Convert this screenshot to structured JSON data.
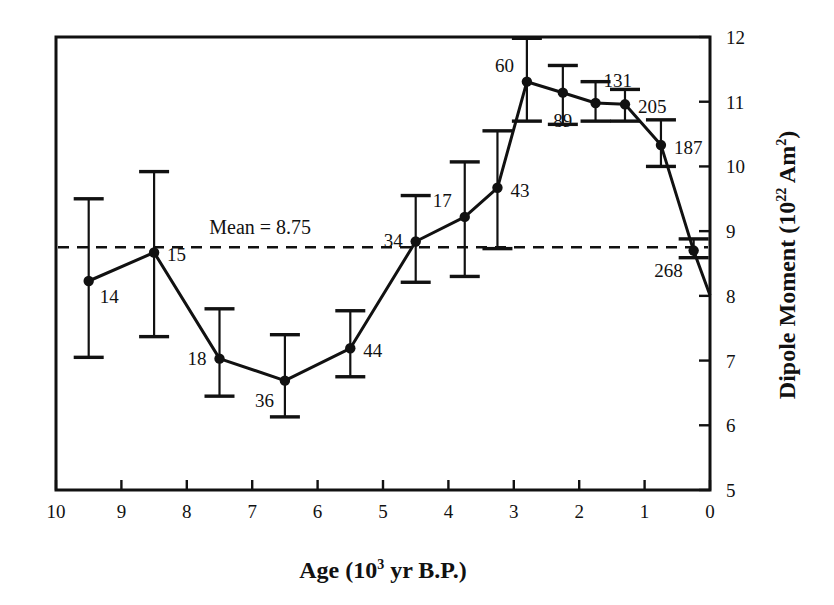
{
  "chart_data": {
    "type": "line",
    "title": "",
    "xlabel": "Age (10^3 yr B.P.)",
    "xlabel_parts": {
      "pre": "Age (10",
      "sup": "3",
      "post": " yr B.P.)"
    },
    "ylabel": "Dipole Moment (10^22 Am^2)",
    "ylabel_parts": {
      "pre": "Dipole Moment (10",
      "sup1": "22",
      "mid": " Am",
      "sup2": "2",
      "post": ")"
    },
    "xlim": [
      10,
      0
    ],
    "ylim": [
      5,
      12
    ],
    "x_reversed": true,
    "grid": false,
    "legend": "none",
    "xticks": [
      10,
      9,
      8,
      7,
      6,
      5,
      4,
      3,
      2,
      1,
      0
    ],
    "xtick_labels": [
      "10",
      "9",
      "8",
      "7",
      "6",
      "5",
      "4",
      "3",
      "2",
      "1",
      "0"
    ],
    "yticks": [
      5,
      6,
      7,
      8,
      9,
      10,
      11,
      12
    ],
    "ytick_labels": [
      "5",
      "6",
      "7",
      "8",
      "9",
      "10",
      "11",
      "12"
    ],
    "ytick_side": "right",
    "annotations": [
      {
        "name": "mean-line-label",
        "text": "Mean = 8.75",
        "x": 6.1,
        "y": 8.95
      }
    ],
    "mean": {
      "value": 8.75,
      "label": "Mean = 8.75",
      "style": "dashed"
    },
    "x": [
      9.5,
      8.5,
      7.5,
      6.5,
      5.5,
      4.5,
      3.75,
      3.25,
      2.8,
      2.25,
      1.75,
      1.3,
      0.75,
      0.25,
      0.0
    ],
    "values": [
      8.23,
      8.67,
      7.03,
      6.69,
      7.19,
      8.84,
      9.22,
      9.67,
      11.31,
      11.14,
      10.98,
      10.96,
      10.33,
      8.7,
      8.01
    ],
    "point_labels": [
      "14",
      "15",
      "18",
      "36",
      "44",
      "34",
      "17",
      "43",
      "60",
      "89",
      "131",
      "205",
      "187",
      "268",
      ""
    ],
    "point_label_pos": [
      "below-right",
      "right",
      "left",
      "below-left",
      "right",
      "left",
      "above-left",
      "right",
      "above-left",
      "below",
      "above-right",
      "right",
      "right",
      "below-left",
      ""
    ],
    "errors_low": [
      7.05,
      7.37,
      6.45,
      6.13,
      6.75,
      8.21,
      8.3,
      8.73,
      10.7,
      10.65,
      10.7,
      10.7,
      10.0,
      8.59,
      null
    ],
    "errors_high": [
      9.5,
      9.92,
      7.8,
      7.4,
      7.77,
      9.55,
      10.07,
      10.55,
      11.98,
      11.56,
      11.31,
      11.19,
      10.72,
      8.88,
      null
    ],
    "series": [
      {
        "name": "Dipole Moment",
        "points": [
          {
            "x": 9.5,
            "y": 8.23,
            "label": "14",
            "lo": 7.05,
            "hi": 9.5
          },
          {
            "x": 8.5,
            "y": 8.67,
            "label": "15",
            "lo": 7.37,
            "hi": 9.92
          },
          {
            "x": 7.5,
            "y": 7.03,
            "label": "18",
            "lo": 6.45,
            "hi": 7.8
          },
          {
            "x": 6.5,
            "y": 6.69,
            "label": "36",
            "lo": 6.13,
            "hi": 7.4
          },
          {
            "x": 5.5,
            "y": 7.19,
            "label": "44",
            "lo": 6.75,
            "hi": 7.77
          },
          {
            "x": 4.5,
            "y": 8.84,
            "label": "34",
            "lo": 8.21,
            "hi": 9.55
          },
          {
            "x": 3.75,
            "y": 9.22,
            "label": "17",
            "lo": 8.3,
            "hi": 10.07
          },
          {
            "x": 3.25,
            "y": 9.67,
            "label": "43",
            "lo": 8.73,
            "hi": 10.55
          },
          {
            "x": 2.8,
            "y": 11.31,
            "label": "60",
            "lo": 10.7,
            "hi": 11.98
          },
          {
            "x": 2.25,
            "y": 11.14,
            "label": "89",
            "lo": 10.65,
            "hi": 11.56
          },
          {
            "x": 1.75,
            "y": 10.98,
            "label": "131",
            "lo": 10.7,
            "hi": 11.31
          },
          {
            "x": 1.3,
            "y": 10.96,
            "label": "205",
            "lo": 10.7,
            "hi": 11.19
          },
          {
            "x": 0.75,
            "y": 10.33,
            "label": "187",
            "lo": 10.0,
            "hi": 10.72
          },
          {
            "x": 0.25,
            "y": 8.7,
            "label": "268",
            "lo": 8.59,
            "hi": 8.88
          },
          {
            "x": 0.0,
            "y": 8.01,
            "label": "",
            "lo": null,
            "hi": null
          }
        ]
      }
    ],
    "colors": {
      "line": "#111111",
      "marker": "#111111",
      "error": "#111111",
      "mean": "#111111"
    }
  }
}
